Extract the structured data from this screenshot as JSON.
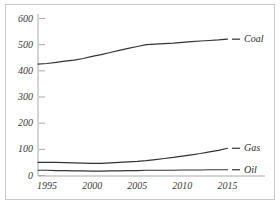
{
  "chart_data": {
    "type": "line",
    "title": "",
    "subtitle": "",
    "xlabel": "",
    "ylabel": "",
    "x": [
      1994,
      1995,
      1996,
      1997,
      1998,
      1999,
      2000,
      2001,
      2002,
      2003,
      2004,
      2005,
      2006,
      2007,
      2008,
      2009,
      2010,
      2011,
      2012,
      2013,
      2014,
      2015
    ],
    "xlim": [
      1994,
      2015.5
    ],
    "ylim": [
      0,
      620
    ],
    "grid": false,
    "legend_position": "line-end-labels",
    "xticks": [
      1995,
      2000,
      2005,
      2010,
      2015
    ],
    "xtick_labels": [
      "1995",
      "2000",
      "2005",
      "2010",
      "2015"
    ],
    "yticks": [
      0,
      100,
      200,
      300,
      400,
      500,
      600
    ],
    "ytick_labels": [
      "0",
      "100",
      "200",
      "300",
      "400",
      "500",
      "600"
    ],
    "series": [
      {
        "name": "Coal",
        "color": "#333333",
        "values": [
          426,
          428,
          432,
          437,
          441,
          447,
          455,
          462,
          470,
          478,
          486,
          493,
          500,
          502,
          504,
          506,
          509,
          512,
          514,
          516,
          518,
          521
        ]
      },
      {
        "name": "Gas",
        "color": "#333333",
        "values": [
          50,
          50,
          50,
          49,
          48,
          47,
          46,
          46,
          48,
          50,
          52,
          54,
          57,
          61,
          65,
          69,
          74,
          79,
          84,
          90,
          96,
          104
        ]
      },
      {
        "name": "Oil",
        "color": "#333333",
        "values": [
          20,
          20,
          19,
          19,
          18,
          18,
          17,
          17,
          18,
          18,
          19,
          19,
          20,
          20,
          20,
          20,
          21,
          21,
          21,
          22,
          22,
          22
        ]
      }
    ]
  },
  "axis": {
    "tick_mark_glyph": "dash",
    "axis_color": "#aaaaaa",
    "label_color": "#3a3a3a"
  }
}
